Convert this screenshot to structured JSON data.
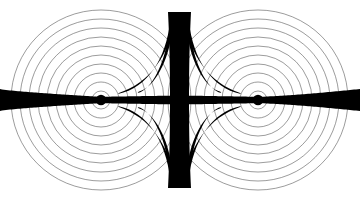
{
  "figure": {
    "width": 360,
    "height": 200,
    "background_color": "#ffffff",
    "stroke_color": "#111111",
    "fill_color": "#000000",
    "ring_stroke_color": "#4a4a4a",
    "ring_stroke_width": 0.55
  },
  "chart_data": {
    "type": "scatter",
    "xlabel": "",
    "ylabel": "",
    "xlim": [
      0,
      360
    ],
    "ylim": [
      0,
      200
    ],
    "grid": false,
    "legend": "none",
    "sources": [
      {
        "name": "left-source",
        "x": 101,
        "y": 100,
        "dot_radius": 5.2
      },
      {
        "name": "right-source",
        "x": 258,
        "y": 100,
        "dot_radius": 5.2
      }
    ],
    "ring_count": 10,
    "ring_radius_step": 9.0,
    "ring_first_radius": 9.0,
    "ring_max_radius": 90.0,
    "ring_radii": [
      9,
      18,
      27,
      36,
      45,
      54,
      63,
      72,
      81,
      90
    ],
    "axis_line": {
      "name": "horizontal-axis-band",
      "y": 100,
      "x_start": 0,
      "x_end": 360,
      "half_thickness_at_edge": 11,
      "half_thickness_at_source": 3.2,
      "half_thickness_at_center": 4.5
    },
    "center_band": {
      "name": "vertical-bisector-band",
      "x": 179.5,
      "y_start": 12,
      "y_end": 188,
      "half_width_at_center": 9.5,
      "half_width_at_ends": 11.5
    },
    "horns": [
      {
        "name": "horn-upper-left",
        "from_x": 170,
        "from_y": 22,
        "to_x": 118,
        "to_y": 94
      },
      {
        "name": "horn-upper-right",
        "from_x": 189,
        "from_y": 22,
        "to_x": 241,
        "to_y": 94
      },
      {
        "name": "horn-lower-left",
        "from_x": 170,
        "from_y": 178,
        "to_x": 118,
        "to_y": 106
      },
      {
        "name": "horn-lower-right",
        "from_x": 189,
        "from_y": 178,
        "to_x": 241,
        "to_y": 106
      }
    ]
  }
}
